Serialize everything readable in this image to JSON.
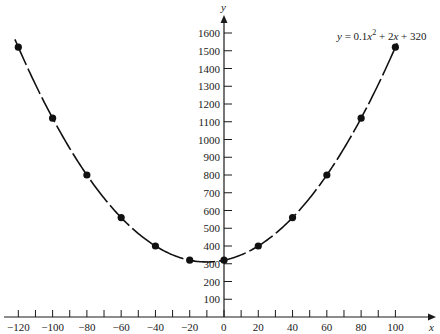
{
  "chart_data": {
    "type": "scatter",
    "title": "",
    "equation": {
      "prefix": "y",
      "text": "y = 0.1x² + 2x + 320",
      "parts": [
        "y",
        " = 0.1",
        "x",
        "2",
        " + 2",
        "x",
        " + 320"
      ]
    },
    "xlabel": "x",
    "ylabel": "y",
    "xlim": [
      -125,
      110
    ],
    "ylim": [
      0,
      1650
    ],
    "x_ticks_labeled": [
      -120,
      -100,
      -80,
      -60,
      -40,
      -20,
      0,
      20,
      40,
      60,
      80,
      100
    ],
    "x_ticks_minor": [
      -110,
      -90,
      -70,
      -50,
      -30,
      -10,
      10,
      30,
      50,
      70,
      90
    ],
    "y_ticks": [
      100,
      200,
      300,
      400,
      500,
      600,
      700,
      800,
      900,
      1000,
      1100,
      1200,
      1300,
      1400,
      1500,
      1600
    ],
    "grid": false,
    "legend": null,
    "series": [
      {
        "name": "y = 0.1x^2 + 2x + 320",
        "x": [
          -120,
          -100,
          -80,
          -60,
          -40,
          -20,
          0,
          20,
          40,
          60,
          80,
          100
        ],
        "values": [
          1520,
          1120,
          800,
          560,
          400,
          320,
          320,
          400,
          560,
          800,
          1120,
          1520
        ],
        "style": "points + smooth curve",
        "color": "#111111"
      }
    ],
    "curve": {
      "a": 0.1,
      "b": 2,
      "c": 320,
      "x_from": -122,
      "x_to": 101
    }
  },
  "layout": {
    "origin_px": [
      224,
      317
    ],
    "px_per_x": 1.714,
    "px_per_y": 0.1775
  }
}
